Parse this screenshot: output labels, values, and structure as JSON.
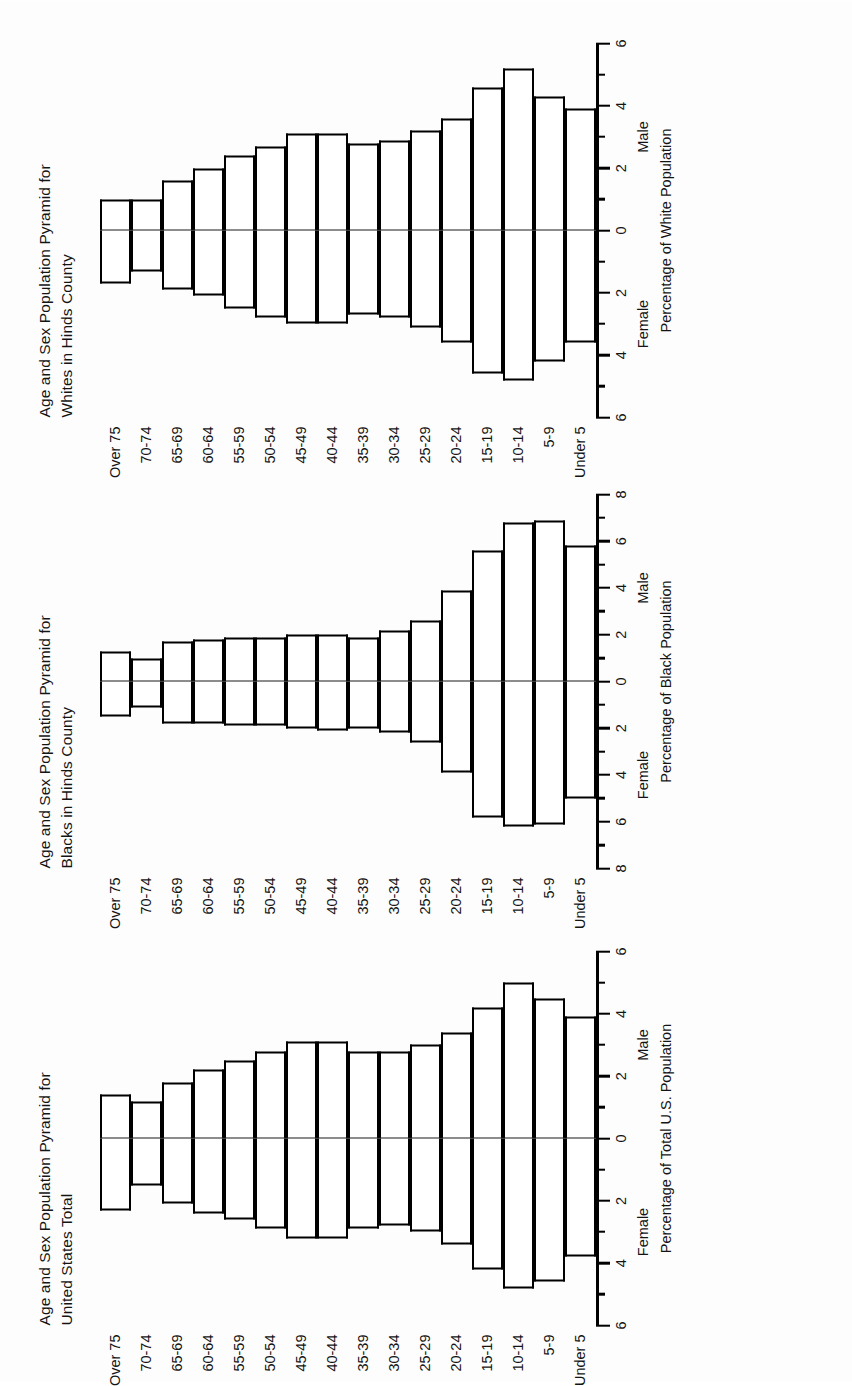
{
  "figure": {
    "orientation": "rotated-90-ccw",
    "background_color": "#ffffff",
    "line_color": "#000000"
  },
  "panels": [
    {
      "title_line1": "Age and Sex Population Pyramid for",
      "title_line2": "United States Total",
      "axis_title": "Percentage of Total U.S. Population",
      "left_label": "Female",
      "right_label": "Male",
      "tick_labels": [
        "6",
        "4",
        "2",
        "0",
        "2",
        "4",
        "6"
      ]
    },
    {
      "title_line1": "Age and Sex Population Pyramid for",
      "title_line2": "Blacks in Hinds County",
      "axis_title": "Percentage of Black Population",
      "left_label": "Female",
      "right_label": "Male",
      "tick_labels": [
        "8",
        "6",
        "4",
        "2",
        "0",
        "2",
        "4",
        "6",
        "8"
      ]
    },
    {
      "title_line1": "Age and Sex Population Pyramid for",
      "title_line2": "Whites in Hinds County",
      "axis_title": "Percentage of White Population",
      "left_label": "Female",
      "right_label": "Male",
      "tick_labels": [
        "6",
        "4",
        "2",
        "0",
        "2",
        "4",
        "6"
      ]
    }
  ],
  "age_groups": [
    "Over 75",
    "70-74",
    "65-69",
    "60-64",
    "55-59",
    "50-54",
    "45-49",
    "40-44",
    "35-39",
    "30-34",
    "25-29",
    "20-24",
    "15-19",
    "10-14",
    "5-9",
    "Under 5"
  ],
  "chart_data": [
    {
      "type": "bar",
      "title": "Age and Sex Population Pyramid for United States Total",
      "xlabel": "Percentage of Total U.S. Population",
      "ylabel": "",
      "xlim": [
        -6,
        6
      ],
      "grid": false,
      "legend": [
        "Female",
        "Male"
      ],
      "legend_position": "below-axis",
      "categories": [
        "Over 75",
        "70-74",
        "65-69",
        "60-64",
        "55-59",
        "50-54",
        "45-49",
        "40-44",
        "35-39",
        "30-34",
        "25-29",
        "20-24",
        "15-19",
        "10-14",
        "5-9",
        "Under 5"
      ],
      "series": [
        {
          "name": "Female",
          "values": [
            2.3,
            1.5,
            2.1,
            2.4,
            2.6,
            2.9,
            3.2,
            3.2,
            2.9,
            2.8,
            3.0,
            3.4,
            4.2,
            4.8,
            4.6,
            3.8
          ]
        },
        {
          "name": "Male",
          "values": [
            1.4,
            1.2,
            1.8,
            2.2,
            2.5,
            2.8,
            3.1,
            3.1,
            2.8,
            2.8,
            3.0,
            3.4,
            4.2,
            5.0,
            4.5,
            3.9
          ]
        }
      ]
    },
    {
      "type": "bar",
      "title": "Age and Sex Population Pyramid for Blacks in Hinds County",
      "xlabel": "Percentage of Black Population",
      "ylabel": "",
      "xlim": [
        -8,
        8
      ],
      "grid": false,
      "legend": [
        "Female",
        "Male"
      ],
      "legend_position": "below-axis",
      "categories": [
        "Over 75",
        "70-74",
        "65-69",
        "60-64",
        "55-59",
        "50-54",
        "45-49",
        "40-44",
        "35-39",
        "30-34",
        "25-29",
        "20-24",
        "15-19",
        "10-14",
        "5-9",
        "Under 5"
      ],
      "series": [
        {
          "name": "Female",
          "values": [
            1.5,
            1.1,
            1.8,
            1.8,
            1.9,
            1.9,
            2.0,
            2.1,
            2.0,
            2.2,
            2.6,
            3.9,
            5.8,
            6.2,
            6.1,
            5.0
          ]
        },
        {
          "name": "Male",
          "values": [
            1.3,
            1.0,
            1.7,
            1.8,
            1.9,
            1.9,
            2.0,
            2.0,
            1.9,
            2.2,
            2.6,
            3.9,
            5.6,
            6.8,
            6.9,
            5.8
          ]
        }
      ]
    },
    {
      "type": "bar",
      "title": "Age and Sex Population Pyramid for Whites in Hinds County",
      "xlabel": "Percentage of White Population",
      "ylabel": "",
      "xlim": [
        -6,
        6
      ],
      "grid": false,
      "legend": [
        "Female",
        "Male"
      ],
      "legend_position": "below-axis",
      "categories": [
        "Over 75",
        "70-74",
        "65-69",
        "60-64",
        "55-59",
        "50-54",
        "45-49",
        "40-44",
        "35-39",
        "30-34",
        "25-29",
        "20-24",
        "15-19",
        "10-14",
        "5-9",
        "Under 5"
      ],
      "series": [
        {
          "name": "Female",
          "values": [
            1.7,
            1.3,
            1.9,
            2.1,
            2.5,
            2.8,
            3.0,
            3.0,
            2.7,
            2.8,
            3.1,
            3.6,
            4.6,
            4.8,
            4.2,
            3.6
          ]
        },
        {
          "name": "Male",
          "values": [
            1.0,
            1.0,
            1.6,
            2.0,
            2.4,
            2.7,
            3.1,
            3.1,
            2.8,
            2.9,
            3.2,
            3.6,
            4.6,
            5.2,
            4.3,
            3.9
          ]
        }
      ]
    }
  ]
}
